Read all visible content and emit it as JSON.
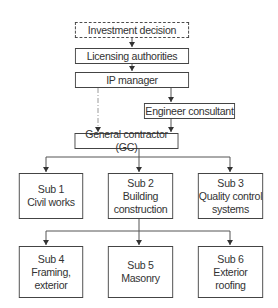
{
  "diagram": {
    "type": "organizational-flowchart",
    "nodes": [
      {
        "id": "investment",
        "label": "Investment decision",
        "style": "dashed"
      },
      {
        "id": "licensing",
        "label": "Licensing authorities",
        "style": "solid"
      },
      {
        "id": "ip_manager",
        "label": "IP manager",
        "style": "solid"
      },
      {
        "id": "engineer",
        "label": "Engineer consultant",
        "style": "solid"
      },
      {
        "id": "gc",
        "label": "General contractor (GC)",
        "style": "solid"
      },
      {
        "id": "sub1",
        "label": "Sub 1\nCivil works",
        "style": "solid"
      },
      {
        "id": "sub2",
        "label": "Sub 2\nBuilding\nconstruction",
        "style": "solid"
      },
      {
        "id": "sub3",
        "label": "Sub 3\nQuality control\nsystems",
        "style": "solid"
      },
      {
        "id": "sub4",
        "label": "Sub 4\nFraming,\nexterior",
        "style": "solid"
      },
      {
        "id": "sub5",
        "label": "Sub 5\nMasonry",
        "style": "solid"
      },
      {
        "id": "sub6",
        "label": "Sub 6\nExterior\nroofing",
        "style": "solid"
      }
    ],
    "edges": [
      {
        "from": "investment",
        "to": "licensing",
        "style": "solid"
      },
      {
        "from": "licensing",
        "to": "ip_manager",
        "style": "solid"
      },
      {
        "from": "ip_manager",
        "to": "engineer",
        "style": "solid"
      },
      {
        "from": "ip_manager",
        "to": "gc",
        "style": "dash-dot"
      },
      {
        "from": "engineer",
        "to": "gc",
        "style": "solid"
      },
      {
        "from": "gc",
        "to": "sub1",
        "style": "solid"
      },
      {
        "from": "gc",
        "to": "sub2",
        "style": "solid"
      },
      {
        "from": "gc",
        "to": "sub3",
        "style": "solid"
      },
      {
        "from": "sub2",
        "to": "sub4",
        "style": "solid"
      },
      {
        "from": "sub2",
        "to": "sub5",
        "style": "solid"
      },
      {
        "from": "sub2",
        "to": "sub6",
        "style": "solid"
      }
    ]
  },
  "colors": {
    "line": "#444444",
    "dashdot_line": "#9a9a9a",
    "text": "#333333",
    "background": "#ffffff"
  }
}
